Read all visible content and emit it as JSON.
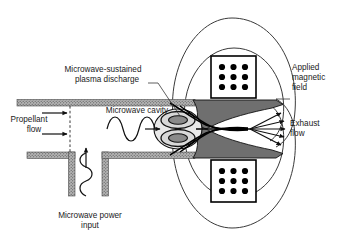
{
  "figure": {
    "background_color": "#ffffff",
    "width": 341,
    "height": 240
  },
  "labels": {
    "plasma_discharge_line1": "Microwave-sustained",
    "plasma_discharge_line2": "plasma discharge",
    "microwave_cavity": "Microwave cavity",
    "propellant_flow_line1": "Propellant",
    "propellant_flow_line2": "flow",
    "applied_magnetic_field_line1": "Applied",
    "applied_magnetic_field_line2": "magnetic",
    "applied_magnetic_field_line3": "field",
    "exhaust_flow_line1": "Exhaust",
    "exhaust_flow_line2": "flow",
    "microwave_power_line1": "Microwave power",
    "microwave_power_line2": "input"
  },
  "components": {
    "magnet_coil_upper": {
      "name": "magnet-coil-upper",
      "dot_rows": 3,
      "dot_columns": 3,
      "dot_count": 9
    },
    "magnet_coil_lower": {
      "name": "magnet-coil-lower",
      "dot_rows": 3,
      "dot_columns": 3,
      "dot_count": 9
    },
    "field_lines": {
      "upper_circles": 2,
      "lower_circles": 2
    },
    "plasma_lobes": 2,
    "exhaust_arrows": 5,
    "propellant_arrows": 2,
    "microwave_wave_cycles": 2
  },
  "colors": {
    "wall_fill": "#a8a8a8",
    "nozzle_fill": "#6f6f6f",
    "plasma_core": "#8a8a8a",
    "plasma_halo": "#d8d8d8",
    "line": "#1a1a1a",
    "background": "#ffffff"
  }
}
